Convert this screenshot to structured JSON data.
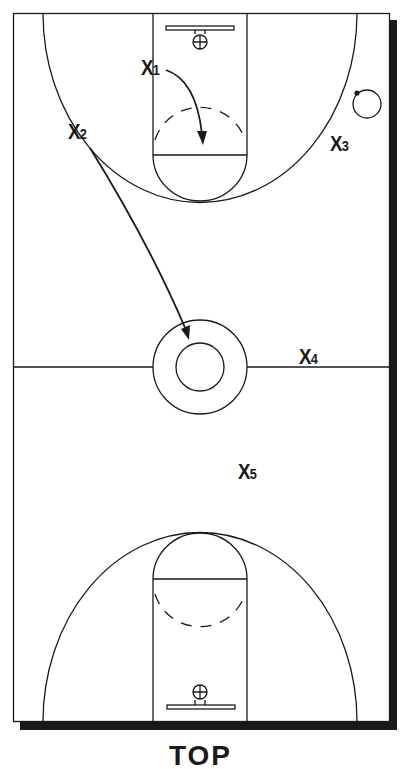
{
  "diagram": {
    "type": "basketball full-court play diagram",
    "colors": {
      "line": "#1a1a1a",
      "shadow": "#1a1a1a",
      "background": "#ffffff"
    },
    "players": [
      {
        "id": "x1",
        "letter": "X",
        "number": "1"
      },
      {
        "id": "x2",
        "letter": "X",
        "number": "2"
      },
      {
        "id": "x3",
        "letter": "X",
        "number": "3"
      },
      {
        "id": "x4",
        "letter": "X",
        "number": "4"
      },
      {
        "id": "x5",
        "letter": "X",
        "number": "5"
      }
    ],
    "movements": [
      {
        "player": "X1",
        "description": "cut from top of key into free-throw lane"
      },
      {
        "player": "X2",
        "description": "run from left wing to center circle"
      }
    ],
    "ball": "near right wing, top half",
    "caption": "TOP"
  }
}
